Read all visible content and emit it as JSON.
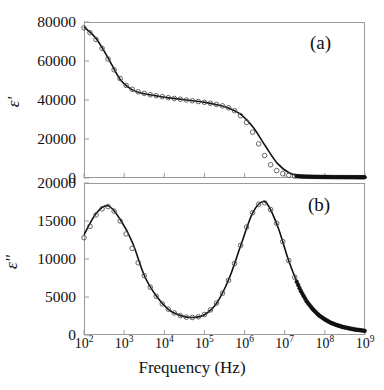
{
  "figure": {
    "xlabel": "Frequency (Hz)",
    "background": "#ffffff",
    "line_color": "#111111",
    "marker_color": "#4d4d4d"
  },
  "panel_a": {
    "tag": "(a)",
    "ylabel": "ε'",
    "yticks": [
      "0",
      "20000",
      "40000",
      "60000",
      "80000"
    ]
  },
  "panel_b": {
    "tag": "(b)",
    "ylabel": "ε''",
    "yticks": [
      "0",
      "5000",
      "10000",
      "15000",
      "20000"
    ]
  },
  "xticks": [
    {
      "mant": "10",
      "exp": "2"
    },
    {
      "mant": "10",
      "exp": "3"
    },
    {
      "mant": "10",
      "exp": "4"
    },
    {
      "mant": "10",
      "exp": "5"
    },
    {
      "mant": "10",
      "exp": "6"
    },
    {
      "mant": "10",
      "exp": "7"
    },
    {
      "mant": "10",
      "exp": "8"
    },
    {
      "mant": "10",
      "exp": "9"
    }
  ],
  "chart_data": [
    {
      "type": "line",
      "id": "panel-a",
      "title": "(a)",
      "xlabel": "Frequency (Hz)",
      "ylabel": "ε'",
      "xscale": "log",
      "xlim": [
        100,
        1000000000
      ],
      "ylim": [
        0,
        80000
      ],
      "yticks": [
        0,
        20000,
        40000,
        60000,
        80000
      ],
      "xticks": [
        100,
        1000,
        10000,
        100000,
        1000000,
        10000000,
        100000000,
        1000000000
      ],
      "grid": false,
      "legend": null,
      "series": [
        {
          "name": "measured (open circles)",
          "marker": "open-circle",
          "x": [
            100,
            141,
            200,
            282,
            398,
            562,
            794,
            1122,
            1585,
            2239,
            3162,
            4467,
            6310,
            8913,
            12589,
            17783,
            25119,
            35481,
            50119,
            70795,
            100000,
            141254,
            199526,
            281838,
            398107,
            562341,
            794328,
            1122018,
            1584893,
            2238721,
            3162278,
            4466836,
            6309573,
            8912509,
            12589254,
            17782794,
            25118864,
            35481339,
            50118723,
            70794578,
            100000000,
            141253754,
            199526231,
            281838293,
            398107171,
            562341325,
            794328235,
            1000000000
          ],
          "y": [
            77000,
            74500,
            71000,
            66500,
            61000,
            55500,
            51000,
            47500,
            45500,
            44200,
            43400,
            42700,
            42200,
            41700,
            41200,
            40800,
            40400,
            40000,
            39600,
            39200,
            38800,
            38300,
            37700,
            37000,
            36000,
            34500,
            32000,
            28500,
            23500,
            17500,
            11500,
            6800,
            3800,
            2200,
            1400,
            1000,
            800,
            700,
            620,
            560,
            520,
            490,
            460,
            440,
            420,
            400,
            390,
            380
          ]
        },
        {
          "name": "model fit (solid line)",
          "marker": "none",
          "x": [
            100,
            200,
            400,
            800,
            1600,
            3200,
            6400,
            12800,
            25600,
            51200,
            102400,
            204800,
            409600,
            819200,
            1638400,
            3276800,
            6553600,
            13107200,
            26214400,
            52428800,
            104857600,
            209715200,
            419430400,
            1000000000
          ],
          "y": [
            77500,
            71500,
            61500,
            50500,
            45200,
            43200,
            42100,
            41100,
            40400,
            39600,
            38800,
            37600,
            35800,
            32500,
            26000,
            16500,
            7500,
            2600,
            1100,
            650,
            500,
            440,
            400,
            375
          ]
        }
      ]
    },
    {
      "type": "line",
      "id": "panel-b",
      "title": "(b)",
      "xlabel": "Frequency (Hz)",
      "ylabel": "ε''",
      "xscale": "log",
      "xlim": [
        100,
        1000000000
      ],
      "ylim": [
        0,
        20000
      ],
      "yticks": [
        0,
        5000,
        10000,
        15000,
        20000
      ],
      "xticks": [
        100,
        1000,
        10000,
        100000,
        1000000,
        10000000,
        100000000,
        1000000000
      ],
      "grid": false,
      "legend": null,
      "peaks": [
        {
          "frequency_hz": 400,
          "value": 17000
        },
        {
          "frequency_hz": 3000000,
          "value": 17500
        }
      ],
      "minimum": {
        "frequency_hz": 35000,
        "value": 2200
      },
      "series": [
        {
          "name": "measured (open circles)",
          "marker": "open-circle",
          "x": [
            100,
            141,
            200,
            282,
            398,
            562,
            794,
            1122,
            1585,
            2239,
            3162,
            4467,
            6310,
            8913,
            12589,
            17783,
            25119,
            35481,
            50119,
            70795,
            100000,
            141254,
            199526,
            281838,
            398107,
            562341,
            794328,
            1122018,
            1584893,
            2238721,
            3162278,
            4466836,
            6309573,
            8912509,
            12589254,
            17782794,
            25118864,
            35481339,
            50118723,
            70794578,
            100000000,
            141253754,
            199526231,
            281838293,
            398107171,
            562341325,
            794328235,
            1000000000
          ],
          "y": [
            12800,
            14300,
            15800,
            16600,
            16900,
            16300,
            15000,
            13300,
            11400,
            9500,
            7800,
            6300,
            5100,
            4100,
            3400,
            2900,
            2550,
            2350,
            2300,
            2400,
            2700,
            3300,
            4200,
            5500,
            7200,
            9400,
            11800,
            14200,
            16100,
            17200,
            17400,
            16500,
            14700,
            12300,
            9800,
            7600,
            5800,
            4400,
            3400,
            2600,
            2050,
            1600,
            1300,
            1050,
            880,
            720,
            620,
            540
          ]
        },
        {
          "name": "model fit (solid line)",
          "marker": "none",
          "x": [
            100,
            200,
            400,
            800,
            1600,
            3200,
            6400,
            12800,
            25600,
            51200,
            102400,
            204800,
            409600,
            819200,
            1638400,
            3276800,
            6553600,
            13107200,
            26214400,
            52428800,
            104857600,
            209715200,
            419430400,
            1000000000
          ],
          "y": [
            13200,
            16000,
            17000,
            15200,
            12200,
            7800,
            5100,
            3350,
            2550,
            2300,
            2700,
            4250,
            7400,
            11900,
            16200,
            17500,
            14400,
            9500,
            5700,
            3200,
            2000,
            1250,
            820,
            520
          ]
        }
      ]
    }
  ]
}
